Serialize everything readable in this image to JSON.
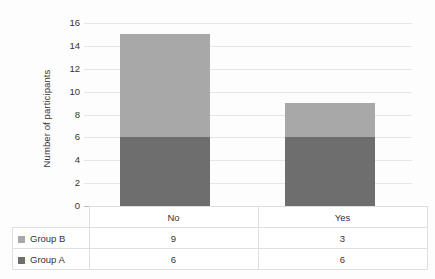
{
  "chart_data": {
    "type": "bar",
    "subtype": "stacked-column",
    "title": "",
    "xlabel": "",
    "ylabel": "Number of participants",
    "categories": [
      "No",
      "Yes"
    ],
    "series": [
      {
        "name": "Group A",
        "values": [
          6,
          6
        ],
        "color": "#6e6e6e"
      },
      {
        "name": "Group B",
        "values": [
          9,
          3
        ],
        "color": "#a8a8a8"
      }
    ],
    "stack_order_bottom_to_top": [
      "Group A",
      "Group B"
    ],
    "totals": [
      15,
      9
    ],
    "ylim": [
      0,
      16
    ],
    "ytick_step": 2,
    "yticks": [
      "16",
      "14",
      "12",
      "10",
      "8",
      "6",
      "4",
      "2",
      "0"
    ],
    "grid": true,
    "legend_position": "data-table-left-column",
    "data_table_visible": true
  },
  "table": {
    "category_row": [
      "No",
      "Yes"
    ],
    "rows": [
      {
        "label": "Group B",
        "color": "#a8a8a8",
        "values": [
          "9",
          "3"
        ]
      },
      {
        "label": "Group A",
        "color": "#6e6e6e",
        "values": [
          "6",
          "6"
        ]
      }
    ]
  },
  "style": {
    "bar_light": "#a8a8a8",
    "bar_dark": "#6e6e6e",
    "gridline": "#e3e6ea",
    "axis": "#b9bcc0",
    "text": "#333333",
    "background": "#fdfdfd"
  }
}
